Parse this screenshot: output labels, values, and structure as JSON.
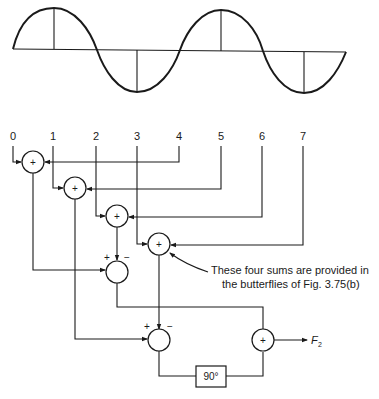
{
  "figure": {
    "waveform": {
      "type": "sine",
      "cycles": 2,
      "sample_markers": 4
    },
    "inputs": [
      "0",
      "1",
      "2",
      "3",
      "4",
      "5",
      "6",
      "7"
    ],
    "adders": [
      {
        "id": "sum-0-4",
        "symbol": "+"
      },
      {
        "id": "sum-1-5",
        "symbol": "+"
      },
      {
        "id": "sum-2-6",
        "symbol": "+"
      },
      {
        "id": "sum-3-7",
        "symbol": "+"
      },
      {
        "id": "diff-a",
        "symbol": "",
        "plus": "+",
        "minus": "−"
      },
      {
        "id": "diff-b",
        "symbol": "",
        "plus": "+",
        "minus": "−"
      },
      {
        "id": "final-sum",
        "symbol": "+"
      }
    ],
    "phase_block": "90°",
    "output_label": "F",
    "output_subscript": "2",
    "annotation_line1": "These four sums are provided in",
    "annotation_line2": "the butterflies of Fig. 3.75(b)"
  }
}
